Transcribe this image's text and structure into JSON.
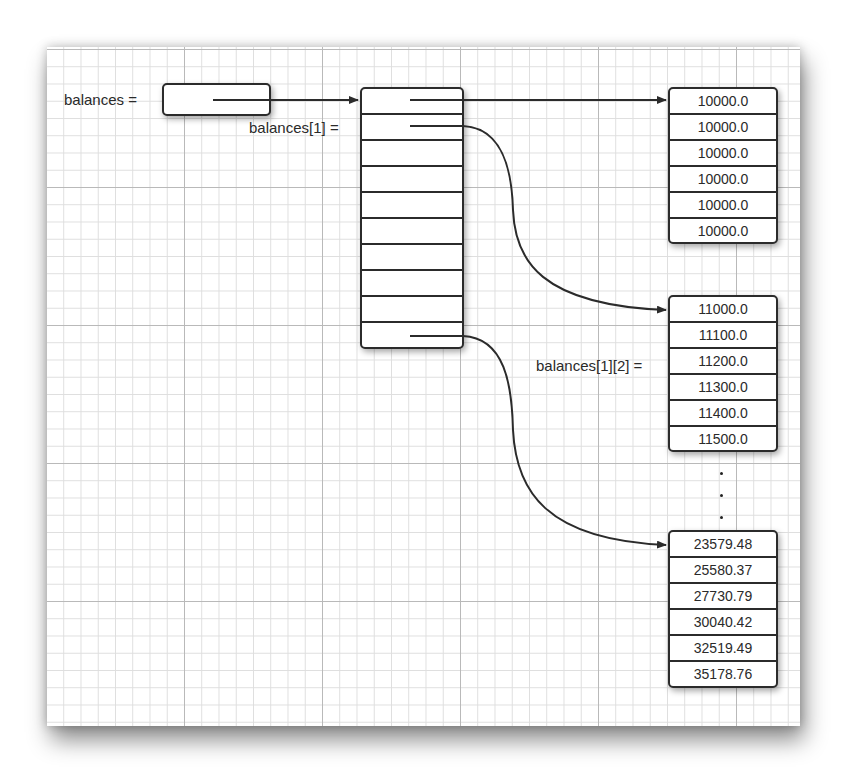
{
  "labels": {
    "balances": "balances =",
    "balances_1": "balances[1] =",
    "balances_1_2": "balances[1][2] ="
  },
  "outer_array": {
    "rows": 10
  },
  "rows": {
    "row0": [
      "10000.0",
      "10000.0",
      "10000.0",
      "10000.0",
      "10000.0",
      "10000.0"
    ],
    "row1": [
      "11000.0",
      "11100.0",
      "11200.0",
      "11300.0",
      "11400.0",
      "11500.0"
    ],
    "row9": [
      "23579.48",
      "25580.37",
      "27730.79",
      "30040.42",
      "32519.49",
      "35178.76"
    ]
  },
  "ellipsis": "⋮",
  "colors": {
    "line": "#2b2b2b",
    "grid_minor": "#dedede",
    "grid_major": "#b9b9b9"
  }
}
